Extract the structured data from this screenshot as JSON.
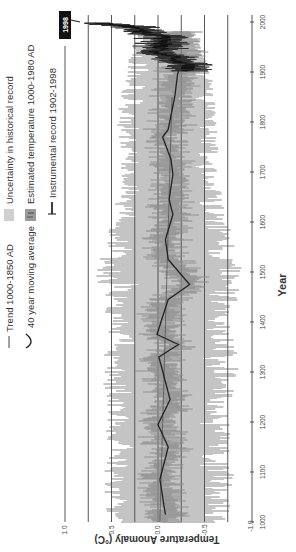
{
  "chart_data": {
    "type": "line",
    "orientation": "rotated 90 degrees clockwise (year axis vertical, read bottom-to-top)",
    "title": "",
    "xlabel": "Year",
    "ylabel": "Temperature Anomaly (°C)",
    "xlim": [
      1000,
      2000
    ],
    "ylim": [
      -1.0,
      1.0
    ],
    "x_ticks": [
      1000,
      1100,
      1200,
      1300,
      1400,
      1500,
      1600,
      1700,
      1800,
      1900,
      2000
    ],
    "y_ticks": [
      1.0,
      0.5,
      0.0,
      -0.5,
      -1.0
    ],
    "y_gridlines": [
      1.0,
      0.75,
      0.5,
      0.25,
      0.0,
      -0.25,
      -0.5,
      -0.75
    ],
    "annotation": "1998",
    "legend": [
      {
        "label": "Trend 1000-1850 AD",
        "symbol": "line"
      },
      {
        "label": "40 year moving average",
        "symbol": "curve"
      },
      {
        "label": "Uncertainty in historical record",
        "symbol": "light-gray-band"
      },
      {
        "label": "Estimated temperature 1000-1980 AD",
        "symbol": "dark-gray-band"
      },
      {
        "label": "Instrumental record 1902-1998",
        "symbol": "black-line"
      }
    ],
    "series": [
      {
        "name": "40 year moving average",
        "x": [
          1015,
          1085,
          1150,
          1195,
          1245,
          1330,
          1355,
          1375,
          1405,
          1445,
          1475,
          1525,
          1565,
          1615,
          1645,
          1695,
          1725,
          1770,
          1785,
          1850,
          1895,
          1920
        ],
        "values": [
          -0.08,
          -0.02,
          -0.11,
          0.0,
          -0.13,
          -0.01,
          -0.22,
          0.01,
          -0.04,
          -0.11,
          -0.34,
          -0.11,
          -0.08,
          -0.16,
          -0.12,
          -0.16,
          -0.14,
          -0.05,
          -0.11,
          -0.18,
          -0.21,
          -0.25
        ]
      },
      {
        "name": "Trend 1000-1850 AD",
        "x": [
          1000,
          1850
        ],
        "values": [
          -0.02,
          -0.15
        ]
      },
      {
        "name": "Instrumental record 1902-1998",
        "x": [
          1902,
          1910,
          1920,
          1930,
          1940,
          1950,
          1960,
          1970,
          1980,
          1990,
          1998
        ],
        "values": [
          -0.25,
          -0.35,
          -0.25,
          -0.15,
          0.0,
          -0.05,
          -0.05,
          -0.05,
          0.15,
          0.3,
          0.6
        ]
      },
      {
        "name": "Uncertainty in historical record",
        "x": [
          1000,
          1100,
          1200,
          1300,
          1400,
          1500,
          1600,
          1700,
          1800,
          1900,
          1980
        ],
        "upper": [
          0.5,
          0.55,
          0.5,
          0.55,
          0.5,
          0.6,
          0.45,
          0.35,
          0.4,
          0.3,
          0.2
        ],
        "lower": [
          -0.7,
          -0.75,
          -0.7,
          -0.8,
          -0.75,
          -0.85,
          -0.7,
          -0.6,
          -0.6,
          -0.55,
          -0.4
        ]
      }
    ]
  },
  "labels": {
    "annotation_1998": "1998",
    "xlabel": "Year",
    "ylabel": "Temperature Anomaly (°C)",
    "legend": {
      "trend": "Trend 1000-1850 AD",
      "moving_avg": "40 year moving average",
      "uncertainty": "Uncertainty in historical record",
      "estimated": "Estimated temperature 1000-1980 AD",
      "instrumental": "Instrumental record 1902-1998"
    },
    "x_ticks": [
      "1000",
      "1100",
      "1200",
      "1300",
      "1400",
      "1500",
      "1600",
      "1700",
      "1800",
      "1900",
      "2000"
    ],
    "y_ticks": [
      "1.0",
      "0.5",
      "0.0",
      "-0.5",
      "-1.0"
    ]
  },
  "colors": {
    "uncertainty": "#c4c4c4",
    "estimated": "#8a8a8a",
    "line": "#222222",
    "grid": "#555555",
    "annotation_bg": "#111111"
  }
}
